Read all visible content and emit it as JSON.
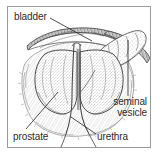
{
  "figure": {
    "kind": "anatomical-illustration",
    "style": "grayscale pencil sketch line drawing",
    "border_color": "#9a9a9a",
    "background_color": "#ffffff",
    "ink_color": "#3a3a3a",
    "text_color": "#2b2b2b"
  },
  "labels": {
    "bladder": "bladder",
    "seminal_vesicle_line1": "seminal",
    "seminal_vesicle_line2": "vesicle",
    "prostate": "prostate",
    "urethra": "urethra"
  },
  "structures": [
    {
      "name": "bladder",
      "description": "dark shaded horizontal wall band across the upper portion of the drawing"
    },
    {
      "name": "seminal vesicle",
      "description": "elongated finger-shaped lobed sac extending up and to the right"
    },
    {
      "name": "prostate",
      "description": "large rounded stippled gland forming the central mass, split into two lobes"
    },
    {
      "name": "urethra",
      "description": "narrow double-walled tube running down through the prostate and curving out below"
    }
  ],
  "leader_lines": [
    {
      "label": "bladder",
      "from": [
        50,
        18
      ],
      "to": [
        92,
        41
      ]
    },
    {
      "label": "seminal vesicle",
      "from": [
        128,
        96
      ],
      "to": [
        128,
        40
      ]
    },
    {
      "label": "prostate",
      "from": [
        26,
        129
      ],
      "to": [
        58,
        92
      ]
    },
    {
      "label": "urethra",
      "from": [
        96,
        134
      ],
      "to": [
        71,
        117
      ]
    }
  ]
}
